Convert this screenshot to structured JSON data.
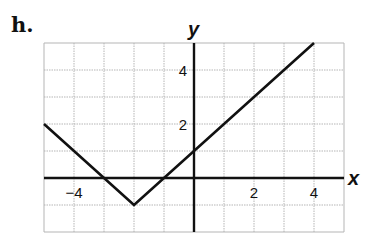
{
  "problem_label": "h.",
  "chart_data": {
    "type": "line",
    "title": "",
    "xlabel": "x",
    "ylabel": "y",
    "xlim": [
      -5,
      5
    ],
    "ylim": [
      -2,
      5
    ],
    "grid": true,
    "x_ticks": [
      {
        "value": -4,
        "label": "−4"
      },
      {
        "value": 2,
        "label": "2"
      },
      {
        "value": 4,
        "label": "4"
      }
    ],
    "y_ticks": [
      {
        "value": 2,
        "label": "2"
      },
      {
        "value": 4,
        "label": "4"
      }
    ],
    "series": [
      {
        "name": "y = |x + 2| - 1",
        "x": [
          -5,
          -2,
          4
        ],
        "y": [
          2,
          -1,
          5
        ]
      }
    ]
  }
}
